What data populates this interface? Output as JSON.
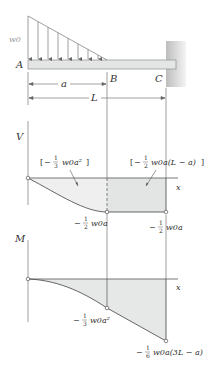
{
  "beam": {
    "load_label": "w0",
    "point_a": "A",
    "point_b": "B",
    "point_c": "C",
    "dim_a": "a",
    "dim_l": "L"
  },
  "shear_diagram": {
    "axis_label": "V",
    "x_label": "x",
    "area_left_label": "[−⅓ w0a²]",
    "area_left": {
      "bracket_open": "[",
      "sign": "−",
      "num": "1",
      "den": "3",
      "body": "w0a²",
      "bracket_close": "]"
    },
    "area_right_label": "[−½ w0a(L − a)]",
    "area_right": {
      "bracket_open": "[",
      "sign": "−",
      "num": "1",
      "den": "2",
      "body": "w0a(L − a)",
      "bracket_close": "]"
    },
    "value_b": {
      "sign": "−",
      "num": "1",
      "den": "2",
      "body": "w0a"
    },
    "value_c": {
      "sign": "−",
      "num": "1",
      "den": "2",
      "body": "w0a"
    }
  },
  "moment_diagram": {
    "axis_label": "M",
    "x_label": "x",
    "value_b": {
      "sign": "−",
      "num": "1",
      "den": "3",
      "body": "w0a²"
    },
    "value_c": {
      "sign": "−",
      "num": "1",
      "den": "6",
      "body": "w0a(3L − a)"
    }
  },
  "colors": {
    "beam_fill": "#e6e8e8",
    "beam_stroke": "#9a9a9a",
    "wall": "#cfcfcf",
    "diagram_fill": "#e9ebeb",
    "line": "#555555"
  }
}
